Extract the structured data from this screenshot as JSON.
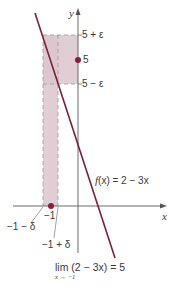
{
  "figure": {
    "axes": {
      "x_label": "x",
      "y_label": "y"
    },
    "function_label": {
      "prefix": "f",
      "rest": "(x) = 2 − 3x"
    },
    "y_tick_labels": {
      "upper": "5 + ε",
      "center": "5",
      "lower": "5 − ε"
    },
    "x_tick_labels": {
      "center": "−1",
      "left": "−1 − δ",
      "right": "−1 + δ"
    },
    "limit_expression": {
      "main": "lim (2 − 3x) = 5",
      "subscript": "x → −1"
    },
    "colors": {
      "line": "#7a2135",
      "point": "#8c1d33",
      "shaded_region": "#d9c2c8",
      "axis": "#6b6b6b",
      "dashed": "#9a9a9a"
    }
  }
}
